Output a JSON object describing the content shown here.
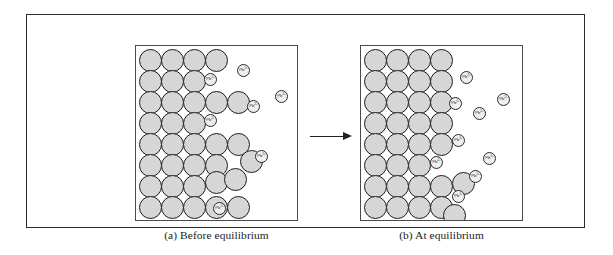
{
  "figure": {
    "panels": [
      {
        "id": "before",
        "caption": "(a) Before equilibrium",
        "ion_label": "Pb",
        "ion_charge": "2+",
        "solid_particles": [
          {
            "x": 3,
            "y": 3,
            "d": 23
          },
          {
            "x": 25,
            "y": 3,
            "d": 23
          },
          {
            "x": 47,
            "y": 3,
            "d": 23
          },
          {
            "x": 69,
            "y": 3,
            "d": 23
          },
          {
            "x": 3,
            "y": 24,
            "d": 23
          },
          {
            "x": 25,
            "y": 24,
            "d": 23
          },
          {
            "x": 47,
            "y": 24,
            "d": 23
          },
          {
            "x": 3,
            "y": 45,
            "d": 23
          },
          {
            "x": 25,
            "y": 45,
            "d": 23
          },
          {
            "x": 47,
            "y": 45,
            "d": 23
          },
          {
            "x": 69,
            "y": 45,
            "d": 23
          },
          {
            "x": 91,
            "y": 45,
            "d": 23
          },
          {
            "x": 3,
            "y": 66,
            "d": 23
          },
          {
            "x": 25,
            "y": 66,
            "d": 23
          },
          {
            "x": 47,
            "y": 66,
            "d": 23
          },
          {
            "x": 3,
            "y": 87,
            "d": 23
          },
          {
            "x": 25,
            "y": 87,
            "d": 23
          },
          {
            "x": 47,
            "y": 87,
            "d": 23
          },
          {
            "x": 69,
            "y": 87,
            "d": 23
          },
          {
            "x": 91,
            "y": 87,
            "d": 23
          },
          {
            "x": 3,
            "y": 108,
            "d": 23
          },
          {
            "x": 25,
            "y": 108,
            "d": 23
          },
          {
            "x": 47,
            "y": 108,
            "d": 23
          },
          {
            "x": 69,
            "y": 108,
            "d": 23
          },
          {
            "x": 104,
            "y": 104,
            "d": 23
          },
          {
            "x": 3,
            "y": 129,
            "d": 23
          },
          {
            "x": 25,
            "y": 129,
            "d": 23
          },
          {
            "x": 47,
            "y": 129,
            "d": 23
          },
          {
            "x": 69,
            "y": 125,
            "d": 23
          },
          {
            "x": 88,
            "y": 122,
            "d": 23
          },
          {
            "x": 3,
            "y": 150,
            "d": 23
          },
          {
            "x": 25,
            "y": 150,
            "d": 23
          },
          {
            "x": 47,
            "y": 150,
            "d": 23
          },
          {
            "x": 69,
            "y": 150,
            "d": 23
          },
          {
            "x": 91,
            "y": 150,
            "d": 23
          }
        ],
        "ions": [
          {
            "x": 68,
            "y": 27,
            "d": 13
          },
          {
            "x": 101,
            "y": 18,
            "d": 13
          },
          {
            "x": 139,
            "y": 44,
            "d": 13
          },
          {
            "x": 111,
            "y": 54,
            "d": 13
          },
          {
            "x": 68,
            "y": 68,
            "d": 13
          },
          {
            "x": 119,
            "y": 104,
            "d": 13
          },
          {
            "x": 77,
            "y": 156,
            "d": 13
          }
        ]
      },
      {
        "id": "at",
        "caption": "(b)  At equilibrium",
        "ion_label": "Pb",
        "ion_charge": "2+",
        "solid_particles": [
          {
            "x": 3,
            "y": 3,
            "d": 23
          },
          {
            "x": 25,
            "y": 3,
            "d": 23
          },
          {
            "x": 47,
            "y": 3,
            "d": 23
          },
          {
            "x": 69,
            "y": 3,
            "d": 23
          },
          {
            "x": 3,
            "y": 24,
            "d": 23
          },
          {
            "x": 25,
            "y": 24,
            "d": 23
          },
          {
            "x": 47,
            "y": 24,
            "d": 23
          },
          {
            "x": 69,
            "y": 24,
            "d": 23
          },
          {
            "x": 3,
            "y": 45,
            "d": 23
          },
          {
            "x": 25,
            "y": 45,
            "d": 23
          },
          {
            "x": 47,
            "y": 45,
            "d": 23
          },
          {
            "x": 69,
            "y": 45,
            "d": 23
          },
          {
            "x": 3,
            "y": 66,
            "d": 23
          },
          {
            "x": 25,
            "y": 66,
            "d": 23
          },
          {
            "x": 47,
            "y": 66,
            "d": 23
          },
          {
            "x": 69,
            "y": 66,
            "d": 23
          },
          {
            "x": 3,
            "y": 87,
            "d": 23
          },
          {
            "x": 25,
            "y": 87,
            "d": 23
          },
          {
            "x": 47,
            "y": 87,
            "d": 23
          },
          {
            "x": 69,
            "y": 87,
            "d": 23
          },
          {
            "x": 3,
            "y": 108,
            "d": 23
          },
          {
            "x": 25,
            "y": 108,
            "d": 23
          },
          {
            "x": 47,
            "y": 108,
            "d": 23
          },
          {
            "x": 3,
            "y": 129,
            "d": 23
          },
          {
            "x": 25,
            "y": 129,
            "d": 23
          },
          {
            "x": 47,
            "y": 129,
            "d": 23
          },
          {
            "x": 69,
            "y": 129,
            "d": 23
          },
          {
            "x": 91,
            "y": 126,
            "d": 23
          },
          {
            "x": 3,
            "y": 150,
            "d": 23
          },
          {
            "x": 25,
            "y": 150,
            "d": 23
          },
          {
            "x": 47,
            "y": 150,
            "d": 23
          },
          {
            "x": 69,
            "y": 150,
            "d": 23
          },
          {
            "x": 82,
            "y": 158,
            "d": 23
          }
        ],
        "ions": [
          {
            "x": 99,
            "y": 25,
            "d": 13
          },
          {
            "x": 88,
            "y": 51,
            "d": 13
          },
          {
            "x": 136,
            "y": 47,
            "d": 13
          },
          {
            "x": 112,
            "y": 61,
            "d": 13
          },
          {
            "x": 91,
            "y": 88,
            "d": 13
          },
          {
            "x": 69,
            "y": 110,
            "d": 13
          },
          {
            "x": 122,
            "y": 106,
            "d": 13
          },
          {
            "x": 108,
            "y": 124,
            "d": 13
          },
          {
            "x": 91,
            "y": 144,
            "d": 13
          }
        ]
      }
    ],
    "arrow": {
      "name": "reaction-arrow",
      "direction": "right"
    },
    "colors": {
      "solid_particle_fill": "#d6d6d6",
      "solid_particle_stroke": "#1d1d1d",
      "ion_fill": "#efefef",
      "ion_stroke": "#2a2a2a",
      "frame_stroke": "#2b2b2b",
      "panel_stroke": "#4a4a4a",
      "background": "#ffffff"
    }
  }
}
